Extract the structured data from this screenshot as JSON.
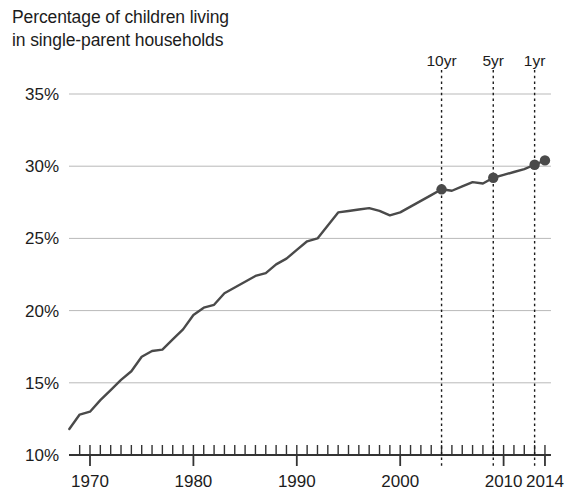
{
  "chart": {
    "title_line1": "Percentage of children living",
    "title_line2": "in single-parent households",
    "title": "Percentage of children living\nin single-parent households"
  },
  "axes": {
    "y_ticks": [
      "10%",
      "15%",
      "20%",
      "25%",
      "30%",
      "35%"
    ],
    "x_ticks": [
      "1970",
      "1980",
      "1990",
      "2000",
      "2010",
      "2014"
    ]
  },
  "annotations": [
    {
      "label": "10yr",
      "year": 2004,
      "value": 28.4
    },
    {
      "label": "5yr",
      "year": 2009,
      "value": 29.2
    },
    {
      "label": "1yr",
      "year": 2013,
      "value": 30.1
    }
  ],
  "colors": {
    "line": "#4a4a4a",
    "marker": "#4a4a4a",
    "grid": "#b9b9b9",
    "axis": "#333333",
    "text": "#1c1c1c",
    "annotation_line": "#1c1c1c",
    "background": "#ffffff"
  },
  "chart_data": {
    "type": "line",
    "title": "Percentage of children living in single-parent households",
    "xlabel": "",
    "ylabel": "",
    "xlim": [
      1968,
      2014
    ],
    "ylim": [
      10,
      35
    ],
    "ytick_values": [
      10,
      15,
      20,
      25,
      30,
      35
    ],
    "ytick_labels": [
      "10%",
      "15%",
      "20%",
      "25%",
      "30%",
      "35%"
    ],
    "xtick_values": [
      1970,
      1980,
      1990,
      2000,
      2010,
      2014
    ],
    "xtick_labels": [
      "1970",
      "1980",
      "1990",
      "2000",
      "2010",
      "2014"
    ],
    "minor_xticks": "every year",
    "grid": "horizontal",
    "legend": "none",
    "units": "percent",
    "x": [
      1968,
      1969,
      1970,
      1971,
      1972,
      1973,
      1974,
      1975,
      1976,
      1977,
      1978,
      1979,
      1980,
      1981,
      1982,
      1983,
      1984,
      1985,
      1986,
      1987,
      1988,
      1989,
      1990,
      1991,
      1992,
      1993,
      1994,
      1995,
      1996,
      1997,
      1998,
      1999,
      2000,
      2001,
      2002,
      2003,
      2004,
      2005,
      2006,
      2007,
      2008,
      2009,
      2010,
      2011,
      2012,
      2013,
      2014
    ],
    "values": [
      11.8,
      12.8,
      13.0,
      13.8,
      14.5,
      15.2,
      15.8,
      16.8,
      17.2,
      17.3,
      18.0,
      18.7,
      19.7,
      20.2,
      20.4,
      21.2,
      21.6,
      22.0,
      22.4,
      22.6,
      23.2,
      23.6,
      24.2,
      24.8,
      25.0,
      25.9,
      26.8,
      26.9,
      27.0,
      27.1,
      26.9,
      26.6,
      26.8,
      27.2,
      27.6,
      28.0,
      28.4,
      28.3,
      28.6,
      28.9,
      28.8,
      29.2,
      29.4,
      29.6,
      29.8,
      30.1,
      30.4
    ],
    "series": [
      {
        "name": "Children in single-parent households",
        "values": [
          11.8,
          12.8,
          13.0,
          13.8,
          14.5,
          15.2,
          15.8,
          16.8,
          17.2,
          17.3,
          18.0,
          18.7,
          19.7,
          20.2,
          20.4,
          21.2,
          21.6,
          22.0,
          22.4,
          22.6,
          23.2,
          23.6,
          24.2,
          24.8,
          25.0,
          25.9,
          26.8,
          26.9,
          27.0,
          27.1,
          26.9,
          26.6,
          26.8,
          27.2,
          27.6,
          28.0,
          28.4,
          28.3,
          28.6,
          28.9,
          28.8,
          29.2,
          29.4,
          29.6,
          29.8,
          30.1,
          30.4
        ]
      }
    ],
    "markers": [
      {
        "label": "10yr",
        "x": 2004,
        "y": 28.4
      },
      {
        "label": "5yr",
        "x": 2009,
        "y": 29.2
      },
      {
        "label": "1yr",
        "x": 2013,
        "y": 30.1
      },
      {
        "label": "",
        "x": 2014,
        "y": 30.4
      }
    ],
    "annotation_lines": [
      {
        "label": "10yr",
        "x": 2004
      },
      {
        "label": "5yr",
        "x": 2009
      },
      {
        "label": "1yr",
        "x": 2013
      }
    ]
  }
}
